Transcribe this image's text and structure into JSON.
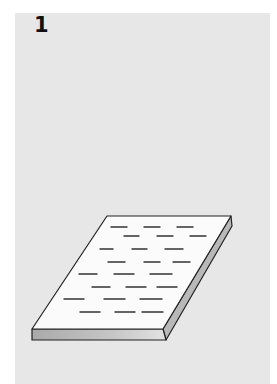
{
  "panel": {
    "step_number": "1",
    "background_color": "#e7e7e7"
  },
  "illustration": {
    "subject": "document-sheet",
    "description": "Isometric view of a flat sheet/slab with rows of dashed text lines on top",
    "colors": {
      "top_face": "#fbfbfb",
      "front_face_dark": "#a9a9a9",
      "front_face_light": "#dcdcdc",
      "side_face": "#b8b8b8",
      "outline": "#222222",
      "text_lines": "#333333"
    },
    "text_line_rows": [
      [
        [
          111,
          127
        ],
        [
          144,
          160
        ],
        [
          177,
          193
        ]
      ],
      [
        [
          124,
          139
        ],
        [
          157,
          173
        ],
        [
          190,
          206
        ]
      ],
      [
        [
          100,
          113
        ],
        [
          132,
          147
        ],
        [
          165,
          183
        ]
      ],
      [
        [
          108,
          125
        ],
        [
          144,
          160
        ],
        [
          173,
          190
        ]
      ],
      [
        [
          79,
          97
        ],
        [
          114,
          134
        ],
        [
          150,
          172
        ]
      ],
      [
        [
          92,
          110
        ],
        [
          126,
          146
        ],
        [
          157,
          177
        ]
      ],
      [
        [
          64,
          84
        ],
        [
          104,
          125
        ],
        [
          140,
          162
        ]
      ],
      [
        [
          80,
          100
        ],
        [
          115,
          135
        ],
        [
          142,
          163
        ]
      ]
    ],
    "text_line_row_y": [
      227,
      236,
      249,
      262,
      274,
      287,
      299,
      312
    ]
  }
}
